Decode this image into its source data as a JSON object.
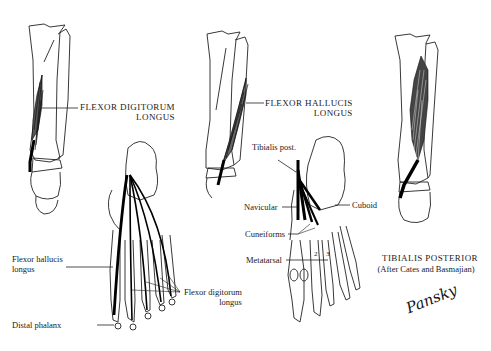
{
  "figure": {
    "panels": [
      {
        "id": "flexor-digitorum-longus",
        "title_line1": "FLEXOR DIGITORUM",
        "title_line2": "LONGUS",
        "foot_labels": {
          "fhl_line1": "Flexor hallucis",
          "fhl_line2": "longus",
          "distal_phalanx": "Distal phalanx",
          "fdl_line1": "Flexor digitorum",
          "fdl_line2": "longus"
        }
      },
      {
        "id": "flexor-hallucis-longus",
        "title_line1": "FLEXOR HALLUCIS",
        "title_line2": "LONGUS",
        "foot_labels": {
          "tibialis_post": "Tibialis post.",
          "navicular": "Navicular",
          "cuboid": "Cuboid",
          "cuneiforms": "Cuneiforms",
          "metatarsal": "Metatarsal",
          "metatarsal_num_2": "2",
          "metatarsal_num_3": "3"
        }
      },
      {
        "id": "tibialis-posterior",
        "title_line1": "TIBIALIS POSTERIOR",
        "title_line2": "(After Cates and Basmajian)"
      }
    ],
    "signature": "Pansky",
    "colors": {
      "background": "#ffffff",
      "ink": "#111111"
    }
  }
}
